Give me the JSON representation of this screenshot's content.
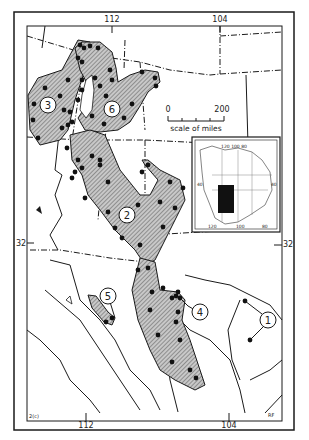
{
  "map": {
    "title": "Distribution map",
    "longitude_labels_top": [
      "112",
      "104"
    ],
    "longitude_labels_bottom": [
      "112",
      "104"
    ],
    "latitude_labels": [
      "32",
      "32"
    ],
    "scale_bar": {
      "start": "0",
      "end": "200",
      "caption": "scale of miles"
    },
    "inset": {
      "labels_top": [
        "120 100 80"
      ],
      "labels_bottom": [
        "120",
        "100",
        "80"
      ],
      "lat_left": "40",
      "lat_right": "40"
    },
    "regions": [
      {
        "id": "1",
        "label": "1"
      },
      {
        "id": "2",
        "label": "2"
      },
      {
        "id": "3",
        "label": "3"
      },
      {
        "id": "4",
        "label": "4"
      },
      {
        "id": "5",
        "label": "5"
      },
      {
        "id": "6",
        "label": "6"
      }
    ],
    "corner_label_left": "2(c)",
    "corner_label_right": "RF",
    "colors": {
      "ink": "#1a1a1a",
      "hatch_fill": "#bdbdbd",
      "background": "#ffffff",
      "inset_fill": "#111111"
    }
  }
}
